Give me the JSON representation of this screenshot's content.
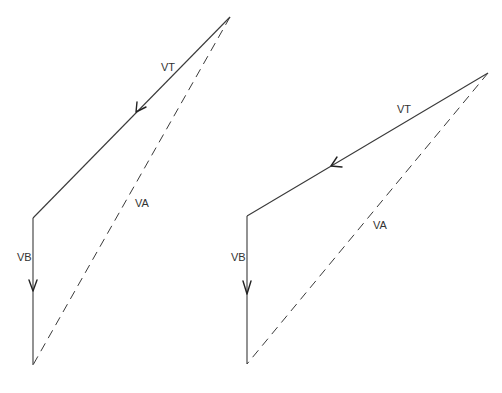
{
  "diagrams": [
    {
      "name": "left-phasor-diagram",
      "points": {
        "top": [
          230,
          17
        ],
        "corner": [
          33,
          218
        ],
        "bottom": [
          33,
          365
        ]
      },
      "vectors": {
        "VT": {
          "label": "VT",
          "label_pos": [
            161,
            71
          ],
          "arrow_tip": [
            136,
            112
          ]
        },
        "VB": {
          "label": "VB",
          "label_pos": [
            17,
            261
          ],
          "arrow_tip": [
            33,
            291
          ]
        },
        "VA": {
          "label": "VA",
          "label_pos": [
            135,
            207
          ]
        }
      }
    },
    {
      "name": "right-phasor-diagram",
      "points": {
        "top": [
          488,
          73
        ],
        "corner": [
          247,
          216
        ],
        "bottom": [
          247,
          364
        ]
      },
      "vectors": {
        "VT": {
          "label": "VT",
          "label_pos": [
            397,
            113
          ],
          "arrow_tip": [
            331,
            166
          ]
        },
        "VB": {
          "label": "VB",
          "label_pos": [
            231,
            261
          ],
          "arrow_tip": [
            247,
            294
          ]
        },
        "VA": {
          "label": "VA",
          "label_pos": [
            373,
            229
          ]
        }
      }
    }
  ],
  "colors": {
    "line": "#3a3a3a",
    "text": "#333333",
    "background": "#ffffff"
  }
}
